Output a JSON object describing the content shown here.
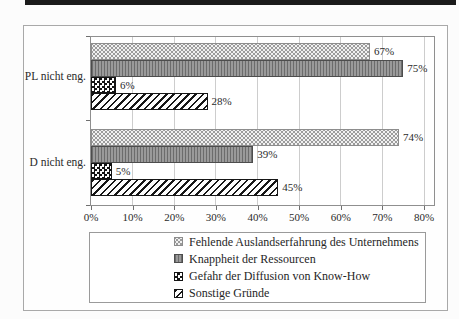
{
  "page": {
    "top_rule_color": "#1b1b1b",
    "background_color": "#fcfcfc"
  },
  "chart_data": {
    "type": "bar",
    "orientation": "horizontal",
    "title": "",
    "xlabel": "",
    "ylabel": "",
    "categories": [
      "PL nicht eng.",
      "D nicht eng."
    ],
    "series": [
      {
        "name": "Fehlende Auslandserfahrung des Unternehmens",
        "pattern": "light-dot-grid",
        "values": [
          67,
          74
        ]
      },
      {
        "name": "Knappheit der Ressourcen",
        "pattern": "gray-vertical-lines",
        "values": [
          75,
          39
        ]
      },
      {
        "name": "Gefahr der Diffusion von Know-How",
        "pattern": "black-white-checkerboard",
        "values": [
          6,
          5
        ]
      },
      {
        "name": "Sonstige Gründe",
        "pattern": "diagonal-stripes",
        "values": [
          28,
          45
        ]
      }
    ],
    "value_label_format": "percent",
    "value_labels": [
      [
        "67%",
        "75%",
        "6%",
        "28%"
      ],
      [
        "74%",
        "39%",
        "5%",
        "45%"
      ]
    ],
    "x_ticks": [
      "0%",
      "10%",
      "20%",
      "30%",
      "40%",
      "50%",
      "60%",
      "70%",
      "80%"
    ],
    "xlim": [
      0,
      80
    ],
    "grid": "vertical",
    "legend_position": "bottom",
    "gridline_color": "#cdcdcd",
    "axis_color": "#8f8f8f"
  }
}
